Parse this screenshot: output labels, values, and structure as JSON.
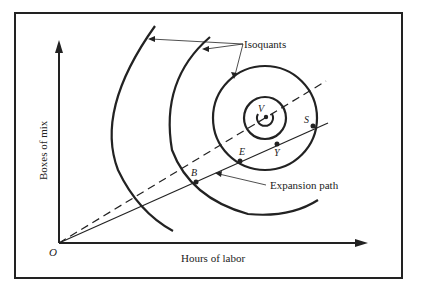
{
  "figure": {
    "caption_partial": "FIGURE 7-7",
    "axes": {
      "x_label": "Hours of labor",
      "y_label": "Boxes of mix",
      "origin_label": "O"
    },
    "annotations": {
      "isoquants": "Isoquants",
      "expansion_path": "Expansion path"
    },
    "points": [
      {
        "label": "V",
        "desc": "peak / maximum output point"
      },
      {
        "label": "S",
        "desc": "point on expansion path at outer isoquant"
      },
      {
        "label": "Y",
        "desc": "point on expansion path"
      },
      {
        "label": "E",
        "desc": "point on expansion path"
      },
      {
        "label": "B",
        "desc": "point on expansion path at second isoquant"
      }
    ],
    "colors": {
      "ink": "#222222",
      "background": "#ffffff"
    }
  }
}
